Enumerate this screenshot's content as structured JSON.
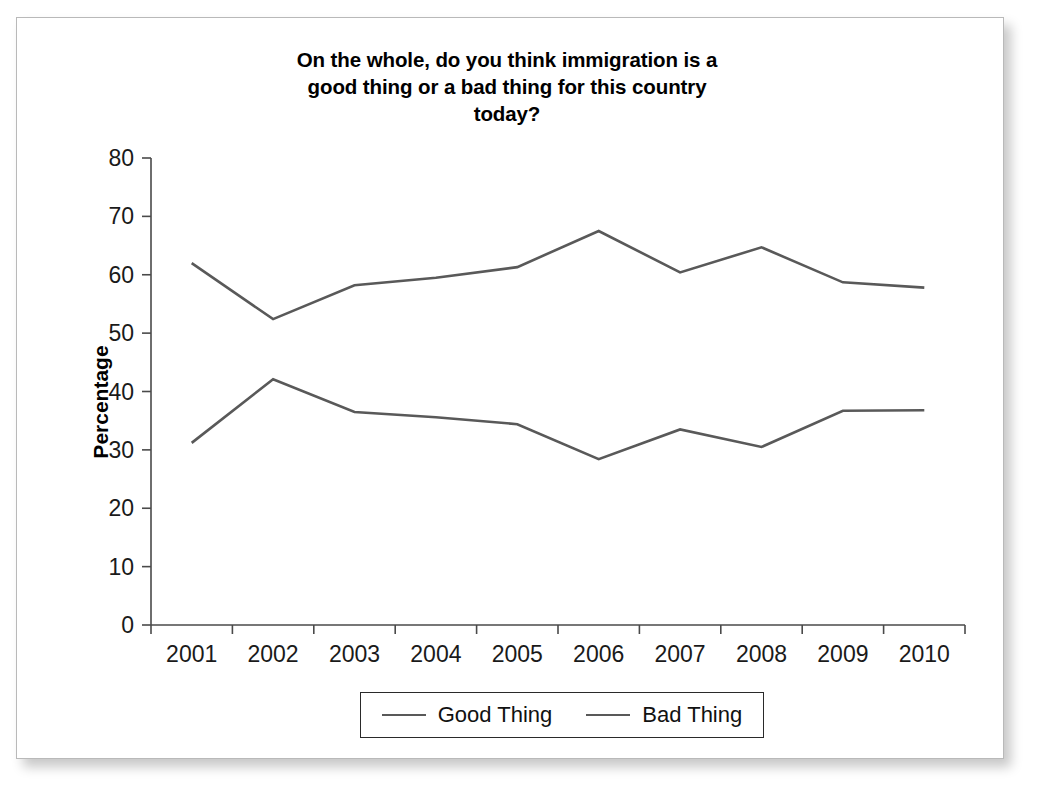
{
  "card": {
    "background": "#ffffff",
    "border_color": "#b9b9b9"
  },
  "chart": {
    "title": "On the whole, do you think immigration is a good thing or a bad thing for this country today?",
    "title_line1": "On the whole, do you think immigration is a",
    "title_line2": "good thing or a bad thing for this country",
    "title_line3": "today?",
    "y_axis_title": "Percentage",
    "line_color": "#595959",
    "axis_color": "#4a4a4a"
  },
  "legend": {
    "position": "bottom",
    "entries": [
      {
        "label": "Good Thing",
        "color": "#595959"
      },
      {
        "label": "Bad Thing",
        "color": "#595959"
      }
    ]
  },
  "chart_data": {
    "type": "line",
    "title": "On the whole, do you think immigration is a good thing or a bad thing for this country today?",
    "xlabel": "",
    "ylabel": "Percentage",
    "categories": [
      "2001",
      "2002",
      "2003",
      "2004",
      "2005",
      "2006",
      "2007",
      "2008",
      "2009",
      "2010"
    ],
    "x_tick_labels": [
      "2001",
      "2002",
      "2003",
      "2004",
      "2005",
      "2006",
      "2007",
      "2008",
      "2009",
      "2010"
    ],
    "y_tick_labels": [
      "0",
      "10",
      "20",
      "30",
      "40",
      "50",
      "60",
      "70",
      "80"
    ],
    "y_ticks": [
      0,
      10,
      20,
      30,
      40,
      50,
      60,
      70,
      80
    ],
    "ylim": [
      0,
      80
    ],
    "grid": false,
    "legend_position": "bottom",
    "series": [
      {
        "name": "Good Thing",
        "color": "#595959",
        "values": [
          62.0,
          52.4,
          58.2,
          59.5,
          61.3,
          67.5,
          60.4,
          64.7,
          58.7,
          57.8
        ]
      },
      {
        "name": "Bad Thing",
        "color": "#595959",
        "values": [
          31.2,
          42.1,
          36.5,
          35.6,
          34.4,
          28.4,
          33.5,
          30.5,
          36.7,
          36.8
        ]
      }
    ]
  }
}
